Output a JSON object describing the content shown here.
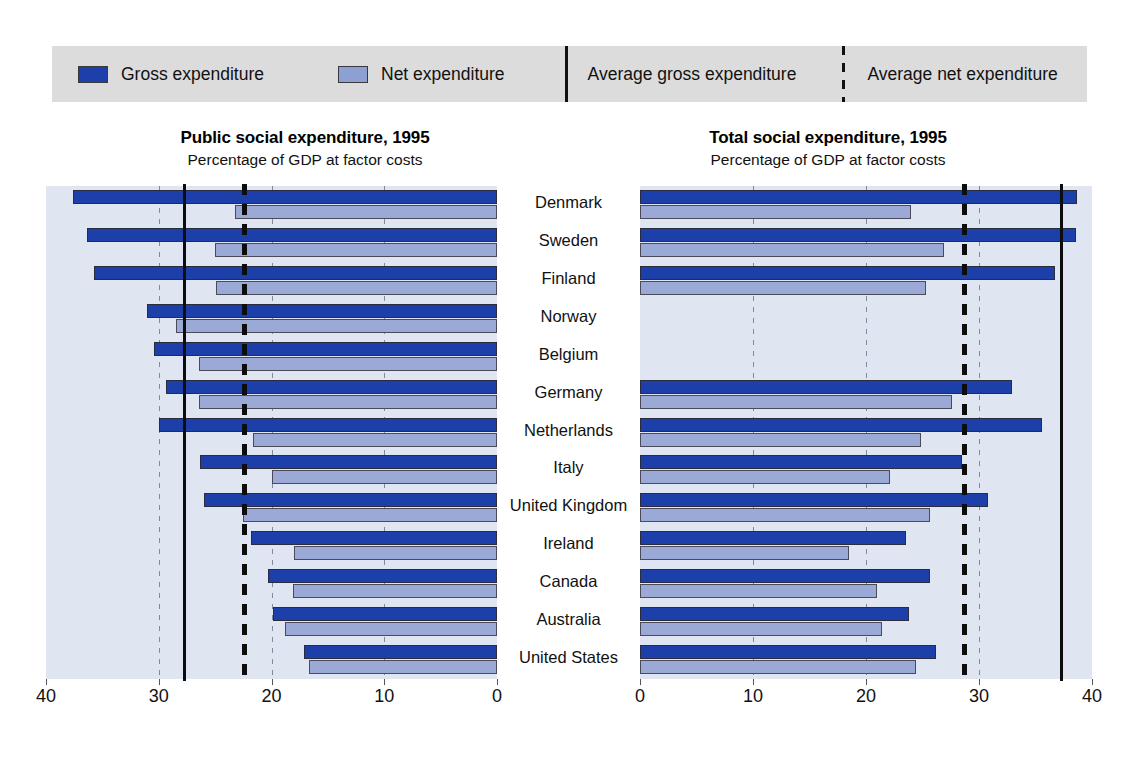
{
  "legend": {
    "items": [
      {
        "name": "gross-expenditure",
        "label": "Gross expenditure",
        "color": "#1c3faa",
        "type": "swatch"
      },
      {
        "name": "net-expenditure",
        "label": "Net expenditure",
        "color": "#8e9fd4",
        "type": "swatch"
      },
      {
        "name": "average-gross-expenditure",
        "label": "Average gross expenditure",
        "color": "#111111",
        "type": "solid-line"
      },
      {
        "name": "average-net-expenditure",
        "label": "Average net expenditure",
        "color": "#111111",
        "type": "dashed-line"
      }
    ],
    "background": "#dcdcdc"
  },
  "chart_data": [
    {
      "id": "public",
      "type": "bar",
      "orientation": "horizontal",
      "direction": "right-to-left",
      "title": "Public social expenditure, 1995",
      "subtitle": "Percentage of GDP at factor costs",
      "xlabel": "",
      "ylabel": "",
      "xlim": [
        40,
        0
      ],
      "ticks": [
        40,
        30,
        20,
        10,
        0
      ],
      "tick_labels": [
        "40",
        "30",
        "20",
        "10",
        "0"
      ],
      "grid": true,
      "gridlines": [
        10,
        20,
        30
      ],
      "legend_position": "top",
      "categories": [
        "Denmark",
        "Sweden",
        "Finland",
        "Norway",
        "Belgium",
        "Germany",
        "Netherlands",
        "Italy",
        "United Kingdom",
        "Ireland",
        "Canada",
        "Australia",
        "United States"
      ],
      "series": [
        {
          "name": "Gross expenditure",
          "color": "#1c3faa",
          "values": [
            37.6,
            36.4,
            35.7,
            31.0,
            30.4,
            29.4,
            30.0,
            26.3,
            26.0,
            21.8,
            20.3,
            19.9,
            17.1
          ]
        },
        {
          "name": "Net expenditure",
          "color": "#9aa9d6",
          "values": [
            23.2,
            25.0,
            24.9,
            28.5,
            26.4,
            26.4,
            21.6,
            20.0,
            22.5,
            18.0,
            18.1,
            18.8,
            16.7
          ]
        }
      ],
      "reference_lines": [
        {
          "name": "Average gross expenditure",
          "value": 27.8,
          "style": "solid",
          "color": "#0d0d0d"
        },
        {
          "name": "Average net expenditure",
          "value": 22.4,
          "style": "dashed",
          "color": "#0d0d0d"
        }
      ]
    },
    {
      "id": "total",
      "type": "bar",
      "orientation": "horizontal",
      "direction": "left-to-right",
      "title": "Total social expenditure, 1995",
      "subtitle": "Percentage of GDP at factor costs",
      "xlabel": "",
      "ylabel": "",
      "xlim": [
        0,
        40
      ],
      "ticks": [
        0,
        10,
        20,
        30,
        40
      ],
      "tick_labels": [
        "0",
        "10",
        "20",
        "30",
        "40"
      ],
      "grid": true,
      "gridlines": [
        10,
        20,
        30
      ],
      "legend_position": "top",
      "categories": [
        "Denmark",
        "Sweden",
        "Finland",
        "Norway",
        "Belgium",
        "Germany",
        "Netherlands",
        "Italy",
        "United Kingdom",
        "Ireland",
        "Canada",
        "Australia",
        "United States"
      ],
      "series": [
        {
          "name": "Gross expenditure",
          "color": "#1c3faa",
          "values": [
            38.7,
            38.6,
            36.7,
            null,
            null,
            32.9,
            35.6,
            28.5,
            30.8,
            23.5,
            25.7,
            23.8,
            26.2
          ]
        },
        {
          "name": "Net expenditure",
          "color": "#9aa9d6",
          "values": [
            24.0,
            26.9,
            25.3,
            null,
            null,
            27.6,
            24.9,
            22.1,
            25.7,
            18.5,
            21.0,
            21.4,
            24.4
          ]
        }
      ],
      "reference_lines": [
        {
          "name": "Average gross expenditure",
          "value": 37.3,
          "style": "solid",
          "color": "#0d0d0d"
        },
        {
          "name": "Average net expenditure",
          "value": 28.7,
          "style": "dashed",
          "color": "#0d0d0d"
        }
      ]
    }
  ]
}
